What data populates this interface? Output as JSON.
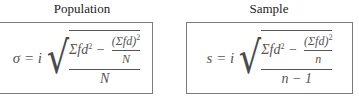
{
  "headers": {
    "population": "Population",
    "sample": "Sample"
  },
  "population_formula": {
    "lhs": "σ = i",
    "numerator_left": "Σfd",
    "numerator_left_exp": "2",
    "minus": " − ",
    "inner_numerator": "(Σfd)",
    "inner_numerator_exp": "2",
    "inner_denominator": "N",
    "denominator": "N"
  },
  "sample_formula": {
    "lhs": "s = i",
    "numerator_left": "Σfd",
    "numerator_left_exp": "2",
    "minus": " − ",
    "inner_numerator": "(Σfd)",
    "inner_numerator_exp": "2",
    "inner_denominator": "n",
    "denominator": "n − 1"
  },
  "colors": {
    "border": "#7a7a7a",
    "text": "#555555",
    "header_text": "#222222"
  }
}
